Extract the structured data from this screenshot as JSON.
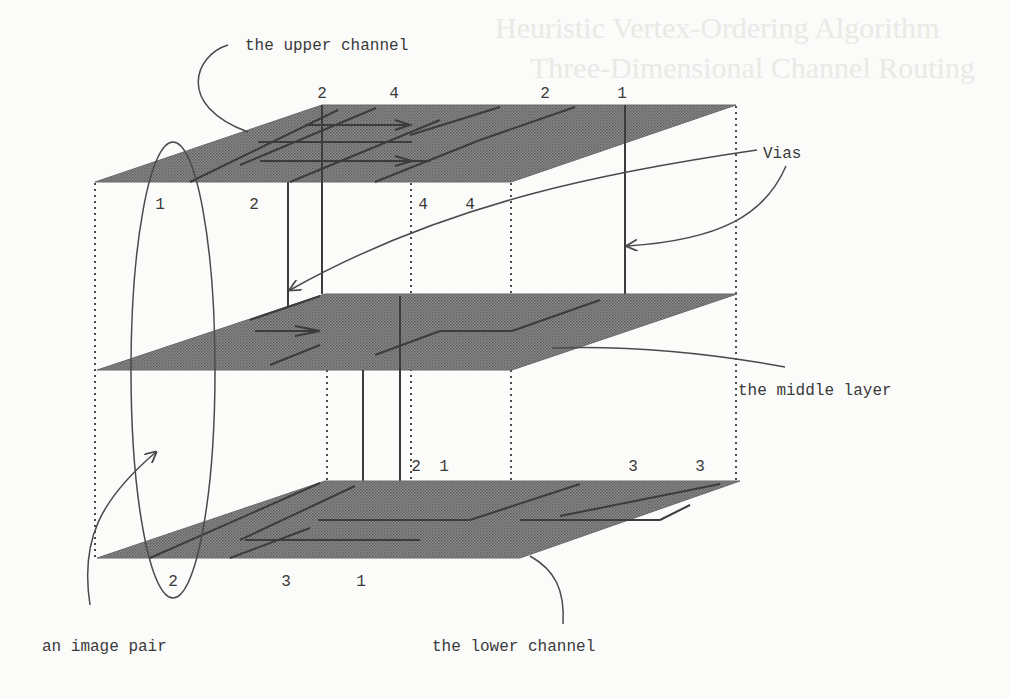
{
  "figure": {
    "type": "3D multilayer channel routing diagram",
    "colors": {
      "background": "#fbfbfa",
      "plane_fill": "#7a7a7a",
      "line": "#3c3c3c",
      "text": "#3a3a3a"
    }
  },
  "labels": {
    "upper_channel": "the upper channel",
    "vias": "Vias",
    "middle_layer": "the middle layer",
    "image_pair": "an image pair",
    "lower_channel": "the lower channel"
  },
  "background_bleed": {
    "line1": "Heuristic Vertex-Ordering Algorithm",
    "line2": "Three-Dimensional Channel Routing"
  },
  "terminals": {
    "upper_top": [
      "2",
      "4",
      "2",
      "1"
    ],
    "upper_bottom": [
      "1",
      "2",
      "4",
      "4"
    ],
    "lower_top": [
      "2",
      "1",
      "3",
      "3"
    ],
    "lower_bottom": [
      "2",
      "3",
      "1"
    ]
  },
  "layers": [
    {
      "name": "upper channel",
      "back_y": 105,
      "front_y": 182
    },
    {
      "name": "middle layer",
      "back_y": 294,
      "front_y": 370
    },
    {
      "name": "lower channel",
      "back_y": 481,
      "front_y": 558
    }
  ]
}
